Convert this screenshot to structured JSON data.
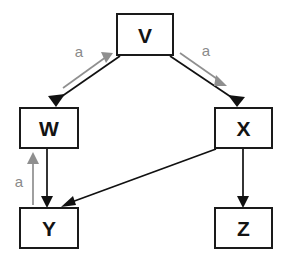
{
  "diagram": {
    "colors": {
      "node_stroke": "#1a1a1a",
      "node_fill": "#ffffff",
      "edge_black": "#111111",
      "annotation_gray": "#8f8f8f",
      "background": "#ffffff"
    },
    "nodes": [
      {
        "id": "V",
        "label": "V",
        "x": 117,
        "y": 14,
        "width": 56,
        "height": 41
      },
      {
        "id": "W",
        "label": "W",
        "x": 20,
        "y": 108,
        "width": 58,
        "height": 40
      },
      {
        "id": "X",
        "label": "X",
        "x": 215,
        "y": 108,
        "width": 57,
        "height": 40
      },
      {
        "id": "Y",
        "label": "Y",
        "x": 20,
        "y": 208,
        "width": 58,
        "height": 40
      },
      {
        "id": "Z",
        "label": "Z",
        "x": 215,
        "y": 208,
        "width": 57,
        "height": 40
      }
    ],
    "edges": [
      {
        "from": "V",
        "to": "W",
        "style": "solid",
        "color": "black",
        "label": ""
      },
      {
        "from": "V",
        "to": "X",
        "style": "solid",
        "color": "black",
        "label": ""
      },
      {
        "from": "W",
        "to": "Y",
        "style": "solid",
        "color": "black",
        "label": ""
      },
      {
        "from": "X",
        "to": "Y",
        "style": "solid",
        "color": "black",
        "label": ""
      },
      {
        "from": "X",
        "to": "Z",
        "style": "solid",
        "color": "black",
        "label": ""
      }
    ],
    "annotations": [
      {
        "id": "a-left-top",
        "label": "a",
        "color": "gray",
        "direction": "up-right",
        "label_x": 79,
        "label_y": 51
      },
      {
        "id": "a-right-top",
        "label": "a",
        "color": "gray",
        "direction": "down-right",
        "label_x": 206,
        "label_y": 50
      },
      {
        "id": "a-left-low",
        "label": "a",
        "color": "gray",
        "direction": "up",
        "label_x": 20,
        "label_y": 181
      }
    ]
  }
}
